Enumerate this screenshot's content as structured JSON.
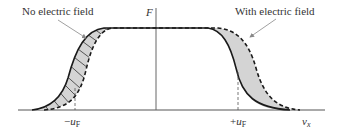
{
  "diagram": {
    "axis_y_label": "F",
    "axis_x_label": "v",
    "axis_x_subscript": "x",
    "annotations": {
      "left": "No electric field",
      "right": "With electric field"
    },
    "ticks": {
      "neg_prefix": "−",
      "pos_prefix": "+",
      "symbol": "u",
      "subscript": "F"
    },
    "colors": {
      "line": "#1a1a1a",
      "fill": "#d4d4d4",
      "axis": "#555555",
      "arrow": "#888888",
      "text": "#333333"
    }
  }
}
